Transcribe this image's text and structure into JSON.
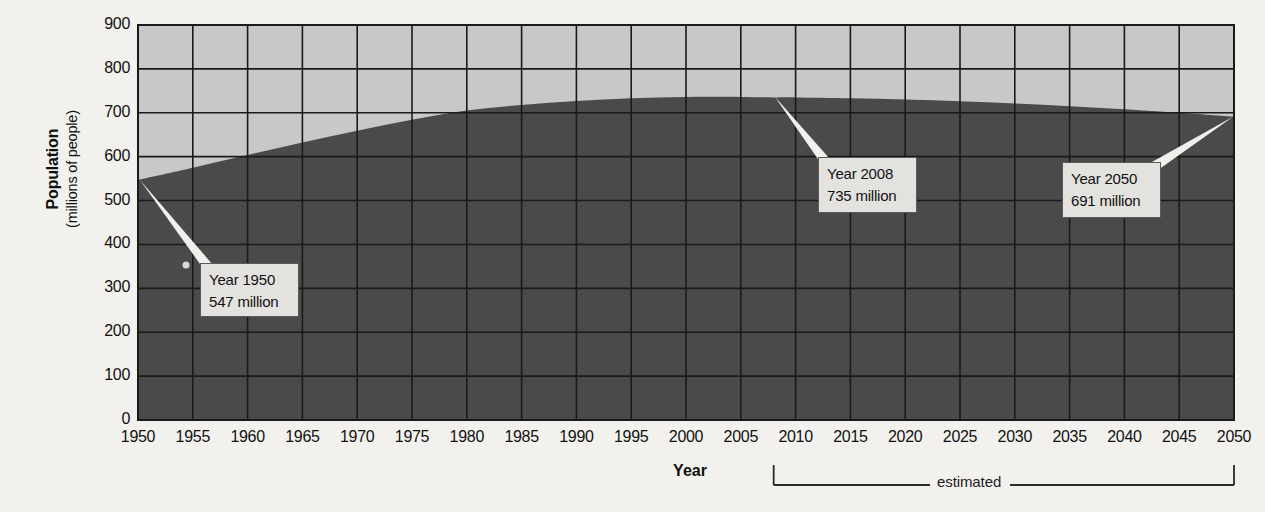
{
  "chart_data": {
    "type": "area",
    "title": "",
    "xlabel": "Year",
    "ylabel": "Population",
    "ylabel_sub": "(millions of people)",
    "xlim": [
      1950,
      2050
    ],
    "ylim": [
      0,
      900
    ],
    "grid": true,
    "legend": "none",
    "y_ticks": [
      "900",
      "800",
      "700",
      "600",
      "500",
      "400",
      "300",
      "200",
      "100",
      "0"
    ],
    "y_tick_values": [
      900,
      800,
      700,
      600,
      500,
      400,
      300,
      200,
      100,
      0
    ],
    "x_ticks": [
      "1950",
      "1955",
      "1960",
      "1965",
      "1970",
      "1975",
      "1980",
      "1985",
      "1990",
      "1995",
      "2000",
      "2005",
      "2010",
      "2015",
      "2020",
      "2025",
      "2030",
      "2035",
      "2040",
      "2045",
      "2050"
    ],
    "x_tick_values": [
      1950,
      1955,
      1960,
      1965,
      1970,
      1975,
      1980,
      1985,
      1990,
      1995,
      2000,
      2005,
      2010,
      2015,
      2020,
      2025,
      2030,
      2035,
      2040,
      2045,
      2050
    ],
    "x": [
      1950,
      1955,
      1960,
      1965,
      1970,
      1975,
      1980,
      1985,
      1990,
      1995,
      2000,
      2005,
      2008,
      2010,
      2015,
      2020,
      2025,
      2030,
      2035,
      2040,
      2045,
      2050
    ],
    "values": [
      547,
      575,
      604,
      632,
      659,
      684,
      705,
      718,
      727,
      733,
      736,
      736,
      735,
      735,
      733,
      730,
      726,
      721,
      715,
      708,
      700,
      691
    ],
    "series": [
      {
        "name": "Population",
        "values": [
          547,
          575,
          604,
          632,
          659,
          684,
          705,
          718,
          727,
          733,
          736,
          736,
          735,
          735,
          733,
          730,
          726,
          721,
          715,
          708,
          700,
          691
        ]
      }
    ],
    "annotations": [
      {
        "year": 1950,
        "value": 735,
        "line1": "Year 1950",
        "line2": "547 million"
      },
      {
        "year": 2008,
        "value": 735,
        "line1": "Year 2008",
        "line2": "735 million"
      },
      {
        "year": 2050,
        "value": 691,
        "line1": "Year 2050",
        "line2": "691 million"
      }
    ],
    "estimated_bracket": {
      "label": "estimated",
      "from_year": 2008,
      "to_year": 2050
    },
    "colors": {
      "area_fill": "#4a4a4a",
      "plot_background": "#c8c8c8",
      "gridline": "#1a1a1a",
      "page_background": "#f2f1ee",
      "callout_background": "#e3e2df",
      "callout_border": "#5a5a5a",
      "leader_line": "#f0efec",
      "text": "#111111"
    }
  },
  "axis": {
    "y_title_main": "Population",
    "y_title_sub": "(millions of people)",
    "x_title": "Year"
  },
  "callouts": {
    "c1": {
      "line1": "Year 1950",
      "line2": "547 million"
    },
    "c2": {
      "line1": "Year 2008",
      "line2": "735 million"
    },
    "c3": {
      "line1": "Year 2050",
      "line2": "691 million"
    }
  },
  "estimated": {
    "label": "estimated"
  }
}
